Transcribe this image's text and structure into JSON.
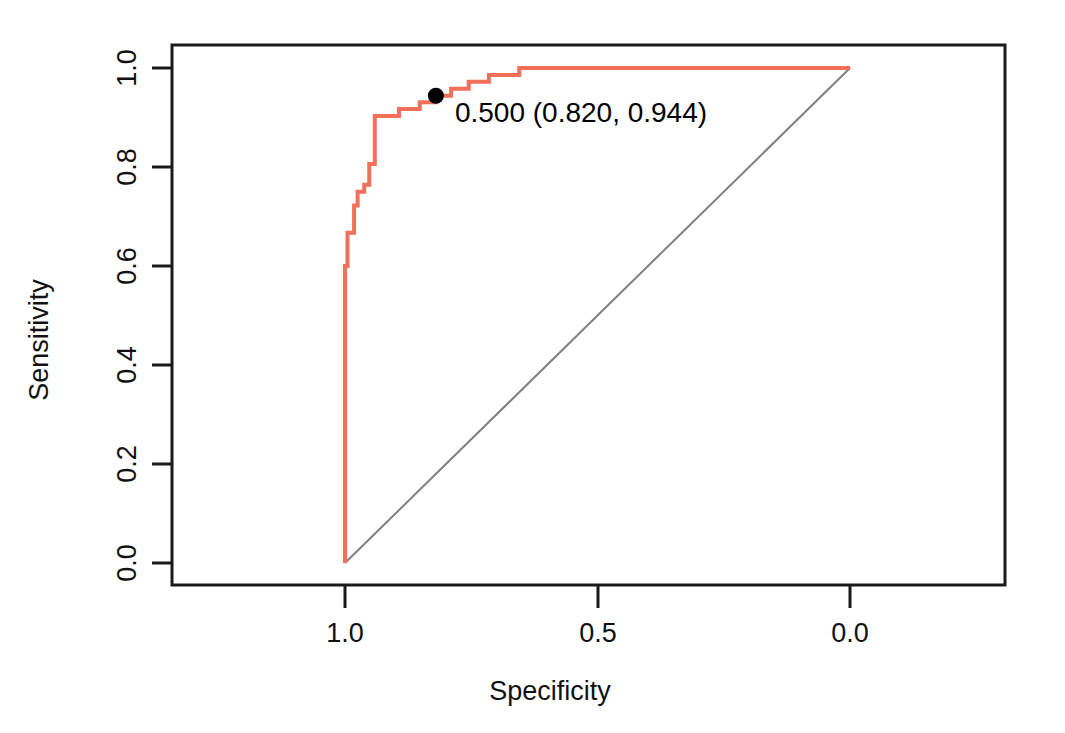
{
  "chart_data": {
    "type": "line",
    "title": "",
    "subtitle": "",
    "xlabel": "Specificity",
    "ylabel": "Sensitivity",
    "xlim": [
      1.0,
      0.0
    ],
    "ylim": [
      0.0,
      1.0
    ],
    "x_axis_reversed": true,
    "grid": false,
    "legend_position": "none",
    "xticks": [
      "1.0",
      "0.5",
      "0.0"
    ],
    "xtick_values": [
      1.0,
      0.5,
      0.0
    ],
    "yticks": [
      "0.0",
      "0.2",
      "0.4",
      "0.6",
      "0.8",
      "1.0"
    ],
    "ytick_values": [
      0.0,
      0.2,
      0.4,
      0.6,
      0.8,
      1.0
    ],
    "series": [
      {
        "name": "ROC curve",
        "color": "#F2705A",
        "line_width": 3,
        "step": true,
        "points": [
          {
            "specificity": 1.0,
            "sensitivity": 0.0
          },
          {
            "specificity": 1.0,
            "sensitivity": 0.6
          },
          {
            "specificity": 0.995,
            "sensitivity": 0.6
          },
          {
            "specificity": 0.995,
            "sensitivity": 0.667
          },
          {
            "specificity": 0.982,
            "sensitivity": 0.667
          },
          {
            "specificity": 0.982,
            "sensitivity": 0.722
          },
          {
            "specificity": 0.975,
            "sensitivity": 0.722
          },
          {
            "specificity": 0.975,
            "sensitivity": 0.75
          },
          {
            "specificity": 0.962,
            "sensitivity": 0.75
          },
          {
            "specificity": 0.962,
            "sensitivity": 0.764
          },
          {
            "specificity": 0.952,
            "sensitivity": 0.764
          },
          {
            "specificity": 0.952,
            "sensitivity": 0.806
          },
          {
            "specificity": 0.941,
            "sensitivity": 0.806
          },
          {
            "specificity": 0.941,
            "sensitivity": 0.903
          },
          {
            "specificity": 0.893,
            "sensitivity": 0.903
          },
          {
            "specificity": 0.893,
            "sensitivity": 0.917
          },
          {
            "specificity": 0.852,
            "sensitivity": 0.917
          },
          {
            "specificity": 0.852,
            "sensitivity": 0.931
          },
          {
            "specificity": 0.82,
            "sensitivity": 0.931
          },
          {
            "specificity": 0.82,
            "sensitivity": 0.944
          },
          {
            "specificity": 0.79,
            "sensitivity": 0.944
          },
          {
            "specificity": 0.79,
            "sensitivity": 0.958
          },
          {
            "specificity": 0.755,
            "sensitivity": 0.958
          },
          {
            "specificity": 0.755,
            "sensitivity": 0.972
          },
          {
            "specificity": 0.715,
            "sensitivity": 0.972
          },
          {
            "specificity": 0.715,
            "sensitivity": 0.986
          },
          {
            "specificity": 0.655,
            "sensitivity": 0.986
          },
          {
            "specificity": 0.655,
            "sensitivity": 1.0
          },
          {
            "specificity": 0.0,
            "sensitivity": 1.0
          }
        ]
      },
      {
        "name": "chance diagonal",
        "color": "#808080",
        "line_width": 1,
        "step": false,
        "points": [
          {
            "specificity": 1.0,
            "sensitivity": 0.0
          },
          {
            "specificity": 0.0,
            "sensitivity": 1.0
          }
        ]
      }
    ],
    "annotations": [
      {
        "label": "0.500 (0.820, 0.944)",
        "threshold": "0.500",
        "specificity": 0.82,
        "sensitivity": 0.944,
        "marker": "filled-circle",
        "marker_color": "#000000",
        "marker_radius": 8
      }
    ]
  }
}
